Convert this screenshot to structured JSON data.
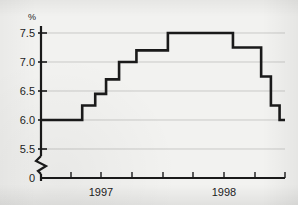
{
  "chart_data": {
    "type": "line",
    "subtype": "step",
    "title": "",
    "subtitle": "",
    "xlabel": "",
    "ylabel": "%",
    "unit_label": "%",
    "ylim": [
      5.35,
      7.65
    ],
    "y_axis_break": true,
    "y_break_label": "0",
    "grid": true,
    "grid_axis": "y",
    "legend": null,
    "legend_position": "none",
    "yticks": [
      7.5,
      7.0,
      6.5,
      6.0,
      5.5
    ],
    "ytick_labels": [
      "7.5",
      "7.0",
      "6.5",
      "6.0",
      "5.5"
    ],
    "xticks": [
      0.25,
      0.5,
      0.75,
      1.0,
      1.25,
      1.5,
      1.75,
      2.0
    ],
    "xtick_labels": [
      "",
      "",
      "",
      "",
      "",
      "",
      "",
      ""
    ],
    "x_category_labels": [
      "1997",
      "1998"
    ],
    "x_domain": [
      1996.75,
      1999.0
    ],
    "series": [
      {
        "name": "interest rate",
        "color": "#1a1a1a",
        "x": [
          1996.75,
          1997.13,
          1997.25,
          1997.35,
          1997.47,
          1997.63,
          1997.92,
          1998.52,
          1998.78,
          1998.87,
          1998.95,
          1999.0
        ],
        "y": [
          6.0,
          6.25,
          6.45,
          6.7,
          7.0,
          7.2,
          7.5,
          7.25,
          6.75,
          6.25,
          6.0,
          6.0
        ],
        "steps": [
          {
            "value": 6.0,
            "label": "6.0"
          },
          {
            "value": 6.25,
            "label": "6.25"
          },
          {
            "value": 6.45,
            "label": "6.45"
          },
          {
            "value": 6.7,
            "label": "6.70"
          },
          {
            "value": 7.0,
            "label": "7.0"
          },
          {
            "value": 7.2,
            "label": "7.20"
          },
          {
            "value": 7.5,
            "label": "7.5"
          },
          {
            "value": 7.25,
            "label": "7.25"
          },
          {
            "value": 6.75,
            "label": "6.75"
          },
          {
            "value": 6.25,
            "label": "6.25"
          },
          {
            "value": 6.0,
            "label": "6.0"
          }
        ]
      }
    ],
    "colors": {
      "line": "#1a1a1a",
      "axis": "#1a1a1a",
      "grid": "#c9c9c7",
      "background": "#f2f2f0",
      "text": "#1c1c1c"
    }
  }
}
